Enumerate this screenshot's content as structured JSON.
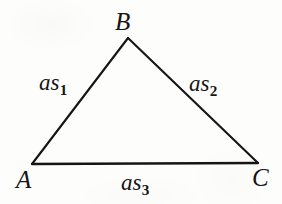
{
  "figure": {
    "kind": "geometry-diagram",
    "shape": "triangle",
    "background_color": "#fdfdfc",
    "stroke_color": "#151515",
    "stroke_width": 2.1,
    "width": 282,
    "height": 204
  },
  "vertices": [
    {
      "id": "A",
      "label": "A",
      "x": 32,
      "y": 164
    },
    {
      "id": "B",
      "label": "B",
      "x": 128,
      "y": 38
    },
    {
      "id": "C",
      "label": "C",
      "x": 258,
      "y": 163
    }
  ],
  "sides": [
    {
      "id": "AB",
      "base": "as",
      "subscript": "1",
      "from": "A",
      "to": "B"
    },
    {
      "id": "BC",
      "base": "as",
      "subscript": "2",
      "from": "B",
      "to": "C"
    },
    {
      "id": "AC",
      "base": "as",
      "subscript": "3",
      "from": "A",
      "to": "C"
    }
  ]
}
